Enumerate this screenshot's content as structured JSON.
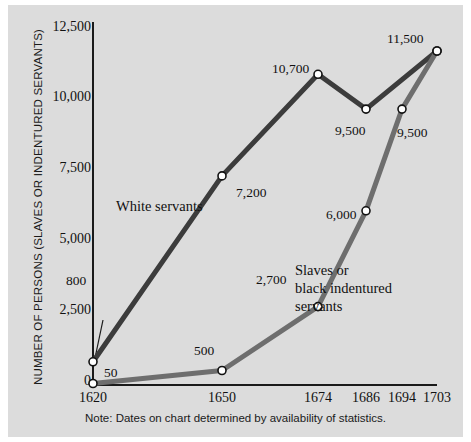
{
  "chart_data": {
    "type": "line",
    "title": "",
    "xlabel": "",
    "ylabel": "NUMBER OF PERSONS (SLAVES OR INDENTURED SERVANTS)",
    "categories": [
      "1620",
      "1650",
      "1674",
      "1686",
      "1694",
      "1703"
    ],
    "yticks": [
      "0",
      "2,500",
      "5,000",
      "7,500",
      "10,000",
      "12,500"
    ],
    "ylim": [
      0,
      12500
    ],
    "grid": false,
    "legend_position": "inline-annotation",
    "note": "Note: Dates on chart determined by availability of statistics.",
    "series": [
      {
        "name": "White servants",
        "color": "#3c3c3c",
        "x": [
          "1620",
          "1650",
          "1674",
          "1686",
          "1703"
        ],
        "values": [
          800,
          7200,
          10700,
          9500,
          11500
        ],
        "point_labels": [
          "800",
          "7,200",
          "10,700",
          "9,500",
          "11,500"
        ]
      },
      {
        "name": "Slaves or black indentured servants",
        "color": "#6e6e6e",
        "x": [
          "1620",
          "1650",
          "1674",
          "1686",
          "1694",
          "1703"
        ],
        "values": [
          50,
          500,
          2700,
          6000,
          9500,
          11500
        ],
        "point_labels": [
          "50",
          "500",
          "2,700",
          "6,000",
          "9,500",
          "11,500"
        ]
      }
    ],
    "annotations": [
      {
        "name": "white-servants-label",
        "text": "White servants"
      },
      {
        "name": "slaves-label-line1",
        "text": "Slaves or"
      },
      {
        "name": "slaves-label-line2",
        "text": "black indentured"
      },
      {
        "name": "slaves-label-line3",
        "text": "servants"
      }
    ]
  }
}
